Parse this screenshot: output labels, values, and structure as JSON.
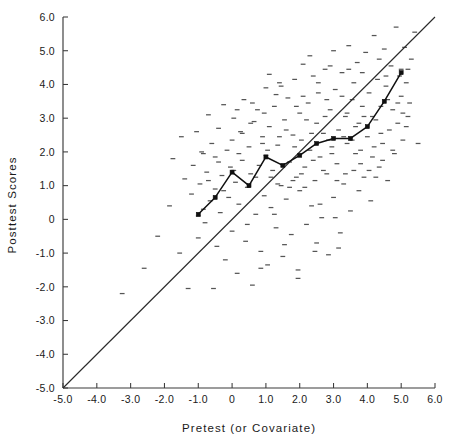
{
  "chart_data": {
    "type": "scatter",
    "title": "",
    "xlabel": "Pretest (or Covariate)",
    "ylabel": "Posttest Scores",
    "xlim": [
      -5.0,
      6.0
    ],
    "ylim": [
      -5.0,
      6.0
    ],
    "grid": false,
    "legend": null,
    "xticks": [
      "-5.0",
      "-4.0",
      "-3.0",
      "-2.0",
      "-1.0",
      "0",
      "1.0",
      "2.0",
      "3.0",
      "4.0",
      "5.0",
      "6.0"
    ],
    "xtick_values": [
      -5.0,
      -4.0,
      -3.0,
      -2.0,
      -1.0,
      0,
      1.0,
      2.0,
      3.0,
      4.0,
      5.0,
      6.0
    ],
    "yticks": [
      "6.0",
      "5.0",
      "4.0",
      "3.0",
      "2.0",
      "1.0",
      "0",
      "-1.0",
      "-2.0",
      "-3.0",
      "-4.0",
      "-5.0"
    ],
    "ytick_values": [
      6.0,
      5.0,
      4.0,
      3.0,
      2.0,
      1.0,
      0,
      -1.0,
      -2.0,
      -3.0,
      -4.0,
      -5.0
    ],
    "annotations": [
      {
        "name": "identity-reference-line",
        "description": "45-degree line y = x from (-5,-5) to (6,6)"
      },
      {
        "name": "binned-means-line",
        "description": "Piecewise linear line connecting binned posttest means"
      }
    ],
    "series": [
      {
        "name": "identity-line",
        "type": "line",
        "points": [
          [
            -5.0,
            -5.0
          ],
          [
            6.0,
            6.0
          ]
        ]
      },
      {
        "name": "binned-means",
        "type": "line",
        "markers": true,
        "points": [
          [
            -1.0,
            0.15
          ],
          [
            -0.5,
            0.65
          ],
          [
            0.0,
            1.4
          ],
          [
            0.5,
            1.0
          ],
          [
            1.0,
            1.85
          ],
          [
            1.5,
            1.6
          ],
          [
            2.0,
            1.9
          ],
          [
            2.5,
            2.25
          ],
          [
            3.0,
            2.4
          ],
          [
            3.5,
            2.4
          ],
          [
            4.0,
            2.75
          ],
          [
            4.5,
            3.5
          ],
          [
            5.0,
            4.35
          ]
        ]
      },
      {
        "name": "observations",
        "type": "scatter",
        "marker": "horizontal-dash",
        "points": [
          [
            -3.25,
            -2.2
          ],
          [
            -2.6,
            -1.45
          ],
          [
            -2.2,
            -0.5
          ],
          [
            -1.85,
            0.4
          ],
          [
            -1.75,
            1.8
          ],
          [
            -1.55,
            -1.0
          ],
          [
            -1.5,
            2.45
          ],
          [
            -1.4,
            1.2
          ],
          [
            -1.3,
            -2.05
          ],
          [
            -1.2,
            0.75
          ],
          [
            -1.15,
            1.6
          ],
          [
            -1.05,
            2.6
          ],
          [
            -1.0,
            0.1
          ],
          [
            -1.0,
            -0.55
          ],
          [
            -0.95,
            1.05
          ],
          [
            -0.9,
            2.0
          ],
          [
            -0.85,
            0.3
          ],
          [
            -0.8,
            -0.1
          ],
          [
            -0.75,
            1.4
          ],
          [
            -0.7,
            3.1
          ],
          [
            -0.65,
            0.55
          ],
          [
            -0.6,
            2.25
          ],
          [
            -0.55,
            -2.05
          ],
          [
            -0.5,
            0.9
          ],
          [
            -0.5,
            1.85
          ],
          [
            -0.45,
            -0.8
          ],
          [
            -0.4,
            2.7
          ],
          [
            -0.35,
            0.2
          ],
          [
            -0.3,
            1.3
          ],
          [
            -0.25,
            3.4
          ],
          [
            -0.2,
            -1.2
          ],
          [
            -0.15,
            2.05
          ],
          [
            -0.1,
            0.65
          ],
          [
            -0.05,
            1.55
          ],
          [
            0.0,
            -0.35
          ],
          [
            0.0,
            2.35
          ],
          [
            0.05,
            3.0
          ],
          [
            0.1,
            1.1
          ],
          [
            0.15,
            -1.6
          ],
          [
            0.2,
            0.45
          ],
          [
            0.25,
            2.6
          ],
          [
            0.3,
            1.75
          ],
          [
            0.35,
            3.55
          ],
          [
            0.4,
            -0.65
          ],
          [
            0.45,
            0.95
          ],
          [
            0.5,
            2.15
          ],
          [
            0.55,
            1.35
          ],
          [
            0.6,
            -1.95
          ],
          [
            0.65,
            2.9
          ],
          [
            0.7,
            0.15
          ],
          [
            0.75,
            3.25
          ],
          [
            0.8,
            1.6
          ],
          [
            0.85,
            -0.95
          ],
          [
            0.9,
            2.45
          ],
          [
            0.95,
            0.7
          ],
          [
            1.0,
            3.9
          ],
          [
            1.0,
            1.9
          ],
          [
            1.05,
            -1.35
          ],
          [
            1.1,
            2.75
          ],
          [
            1.15,
            0.35
          ],
          [
            1.2,
            1.45
          ],
          [
            1.25,
            3.35
          ],
          [
            1.3,
            -0.25
          ],
          [
            1.35,
            2.2
          ],
          [
            1.4,
            4.05
          ],
          [
            1.45,
            1.0
          ],
          [
            1.5,
            -1.1
          ],
          [
            1.55,
            2.95
          ],
          [
            1.6,
            0.6
          ],
          [
            1.65,
            3.6
          ],
          [
            1.7,
            1.7
          ],
          [
            1.75,
            -0.45
          ],
          [
            1.8,
            2.5
          ],
          [
            1.85,
            4.15
          ],
          [
            1.9,
            1.25
          ],
          [
            1.95,
            -1.5
          ],
          [
            2.0,
            3.15
          ],
          [
            2.0,
            0.85
          ],
          [
            2.05,
            2.35
          ],
          [
            2.1,
            4.6
          ],
          [
            2.15,
            1.55
          ],
          [
            2.2,
            -0.15
          ],
          [
            2.25,
            3.45
          ],
          [
            2.3,
            2.05
          ],
          [
            2.35,
            0.4
          ],
          [
            2.4,
            4.25
          ],
          [
            2.45,
            1.15
          ],
          [
            2.5,
            2.85
          ],
          [
            2.5,
            -0.7
          ],
          [
            2.55,
            3.75
          ],
          [
            2.6,
            1.85
          ],
          [
            2.65,
            0.05
          ],
          [
            2.7,
            2.55
          ],
          [
            2.75,
            4.45
          ],
          [
            2.8,
            1.35
          ],
          [
            2.85,
            -1.05
          ],
          [
            2.9,
            3.25
          ],
          [
            2.95,
            2.15
          ],
          [
            3.0,
            5.0
          ],
          [
            3.0,
            0.65
          ],
          [
            3.05,
            3.85
          ],
          [
            3.1,
            1.65
          ],
          [
            3.15,
            2.65
          ],
          [
            3.2,
            -0.4
          ],
          [
            3.25,
            4.35
          ],
          [
            3.3,
            1.05
          ],
          [
            3.35,
            3.05
          ],
          [
            3.4,
            2.25
          ],
          [
            3.45,
            5.15
          ],
          [
            3.5,
            0.25
          ],
          [
            3.55,
            3.55
          ],
          [
            3.6,
            1.45
          ],
          [
            3.65,
            2.75
          ],
          [
            3.7,
            4.65
          ],
          [
            3.75,
            0.85
          ],
          [
            3.8,
            2.05
          ],
          [
            3.85,
            3.35
          ],
          [
            3.9,
            1.25
          ],
          [
            3.95,
            4.95
          ],
          [
            4.0,
            2.45
          ],
          [
            4.05,
            3.75
          ],
          [
            4.1,
            0.55
          ],
          [
            4.15,
            1.85
          ],
          [
            4.2,
            5.45
          ],
          [
            4.25,
            2.95
          ],
          [
            4.3,
            4.15
          ],
          [
            4.35,
            1.55
          ],
          [
            4.4,
            3.35
          ],
          [
            4.45,
            2.25
          ],
          [
            4.5,
            5.05
          ],
          [
            4.55,
            3.95
          ],
          [
            4.6,
            1.15
          ],
          [
            4.65,
            2.65
          ],
          [
            4.7,
            4.55
          ],
          [
            4.75,
            3.25
          ],
          [
            4.8,
            1.95
          ],
          [
            4.85,
            5.7
          ],
          [
            4.9,
            2.85
          ],
          [
            4.95,
            4.25
          ],
          [
            5.0,
            3.65
          ],
          [
            5.05,
            2.35
          ],
          [
            5.1,
            5.1
          ],
          [
            5.15,
            4.05
          ],
          [
            5.2,
            3.05
          ],
          [
            5.3,
            4.75
          ],
          [
            5.4,
            5.55
          ],
          [
            5.5,
            2.25
          ],
          [
            1.3,
            3.7
          ],
          [
            0.6,
            3.45
          ],
          [
            2.2,
            2.95
          ],
          [
            3.3,
            2.45
          ],
          [
            4.2,
            2.15
          ],
          [
            1.9,
            3.35
          ],
          [
            2.8,
            3.55
          ],
          [
            3.6,
            4.05
          ],
          [
            0.3,
            2.55
          ],
          [
            -0.4,
            1.7
          ],
          [
            1.6,
            2.65
          ],
          [
            2.4,
            1.75
          ],
          [
            3.1,
            1.15
          ],
          [
            4.4,
            2.55
          ],
          [
            0.9,
            2.25
          ],
          [
            1.7,
            0.95
          ],
          [
            2.6,
            0.45
          ],
          [
            3.8,
            1.65
          ],
          [
            4.6,
            3.55
          ],
          [
            5.0,
            4.45
          ],
          [
            1.1,
            4.3
          ],
          [
            2.1,
            3.65
          ],
          [
            2.9,
            4.55
          ],
          [
            3.4,
            3.15
          ],
          [
            0.2,
            1.95
          ],
          [
            -0.7,
            1.15
          ],
          [
            1.4,
            2.45
          ],
          [
            2.3,
            4.85
          ],
          [
            3.9,
            3.05
          ],
          [
            4.9,
            3.45
          ],
          [
            0.7,
            1.25
          ],
          [
            1.8,
            1.15
          ],
          [
            2.7,
            1.45
          ],
          [
            3.55,
            2.35
          ],
          [
            4.05,
            1.45
          ],
          [
            5.2,
            4.45
          ],
          [
            1.25,
            0.15
          ],
          [
            2.15,
            0.95
          ],
          [
            3.05,
            0.05
          ],
          [
            0.45,
            -0.15
          ],
          [
            1.55,
            -0.75
          ],
          [
            2.45,
            -0.95
          ],
          [
            3.15,
            -0.85
          ],
          [
            0.85,
            -1.45
          ],
          [
            1.95,
            -1.75
          ],
          [
            2.85,
            2.35
          ],
          [
            3.75,
            2.85
          ],
          [
            4.75,
            2.05
          ],
          [
            0.55,
            2.85
          ],
          [
            -0.25,
            0.85
          ],
          [
            1.45,
            3.95
          ],
          [
            2.55,
            4.05
          ],
          [
            3.45,
            4.45
          ],
          [
            4.35,
            4.75
          ],
          [
            5.05,
            3.15
          ],
          [
            1.15,
            1.25
          ],
          [
            2.05,
            1.35
          ],
          [
            3.25,
            3.65
          ],
          [
            4.15,
            3.05
          ],
          [
            0.05,
            1.45
          ],
          [
            -0.85,
            1.95
          ],
          [
            1.35,
            1.05
          ],
          [
            2.35,
            2.55
          ],
          [
            3.85,
            4.35
          ],
          [
            4.45,
            1.75
          ],
          [
            5.15,
            2.75
          ],
          [
            0.95,
            3.15
          ],
          [
            1.85,
            2.15
          ],
          [
            2.75,
            3.05
          ],
          [
            3.65,
            1.95
          ],
          [
            4.55,
            4.25
          ],
          [
            0.15,
            3.25
          ],
          [
            2.95,
            1.95
          ],
          [
            1.05,
            2.05
          ],
          [
            3.35,
            1.35
          ],
          [
            4.25,
            1.25
          ],
          [
            5.25,
            3.45
          ]
        ]
      }
    ]
  },
  "axes": {
    "x_title": "Pretest (or Covariate)",
    "y_title": "Posttest Scores"
  },
  "colors": {
    "background": "#ffffff",
    "axis": "#3a3a3a",
    "data_point": "#555555",
    "fit_line": "#101010",
    "reference_line": "#2b2b2b",
    "text": "#1a1a1a"
  }
}
